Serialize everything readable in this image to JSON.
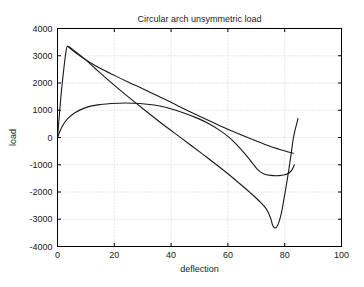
{
  "chart_data": {
    "type": "line",
    "title": "Circular arch unsymmetric load",
    "xlabel": "deflection",
    "ylabel": "load",
    "xlim": [
      0,
      100
    ],
    "ylim": [
      -4000,
      4000
    ],
    "xticks": [
      0,
      20,
      40,
      60,
      80,
      100
    ],
    "yticks": [
      -4000,
      -3000,
      -2000,
      -1000,
      0,
      1000,
      2000,
      3000,
      4000
    ],
    "xticklabels": [
      "0",
      "20",
      "40",
      "60",
      "80",
      "100"
    ],
    "yticklabels": [
      "-4000",
      "-3000",
      "-2000",
      "-1000",
      "0",
      "1000",
      "2000",
      "3000",
      "4000"
    ],
    "grid": true,
    "legend": null,
    "line_color": "#1a1a1a",
    "background": "#ffffff",
    "series": [
      {
        "name": "branch-1-steep-descending",
        "comment": "rises steeply from origin region to peak ~3350 then descends nearly linearly to lower right",
        "points": [
          [
            0,
            0
          ],
          [
            1.2,
            1500
          ],
          [
            2.2,
            2500
          ],
          [
            3.0,
            3150
          ],
          [
            3.6,
            3350
          ],
          [
            6,
            3180
          ],
          [
            9,
            2930
          ],
          [
            13,
            2560
          ],
          [
            17,
            2190
          ],
          [
            21,
            1830
          ],
          [
            26,
            1400
          ],
          [
            31,
            980
          ],
          [
            36,
            570
          ],
          [
            41,
            180
          ],
          [
            46,
            -210
          ],
          [
            51,
            -600
          ],
          [
            56,
            -1000
          ],
          [
            60,
            -1330
          ],
          [
            64,
            -1680
          ],
          [
            68,
            -2040
          ],
          [
            71,
            -2330
          ],
          [
            73.5,
            -2620
          ],
          [
            75,
            -2950
          ],
          [
            75.8,
            -3230
          ],
          [
            76.6,
            -3320
          ],
          [
            77.6,
            -3210
          ],
          [
            78.6,
            -2880
          ],
          [
            79.5,
            -2400
          ],
          [
            80.5,
            -1800
          ],
          [
            81.5,
            -1150
          ],
          [
            82.3,
            -580
          ],
          [
            82.9,
            -120
          ],
          [
            83.4,
            160
          ],
          [
            84.0,
            420
          ],
          [
            84.7,
            700
          ]
        ]
      },
      {
        "name": "branch-2-upper-descending",
        "comment": "from peak ~3350 descending with gentle convex curvature to about -580 at x=83",
        "points": [
          [
            3.6,
            3350
          ],
          [
            7,
            3060
          ],
          [
            11,
            2780
          ],
          [
            15,
            2540
          ],
          [
            20,
            2280
          ],
          [
            25,
            2030
          ],
          [
            30,
            1790
          ],
          [
            35,
            1540
          ],
          [
            40,
            1290
          ],
          [
            45,
            1030
          ],
          [
            50,
            780
          ],
          [
            55,
            540
          ],
          [
            60,
            300
          ],
          [
            65,
            80
          ],
          [
            70,
            -130
          ],
          [
            75,
            -330
          ],
          [
            78,
            -430
          ],
          [
            81,
            -520
          ],
          [
            83,
            -580
          ]
        ]
      },
      {
        "name": "branch-3-low-hump",
        "comment": "from origin rising to hump ~1250 near x=24-30 then falling to minimum ~-1400 near x=68 and back up",
        "points": [
          [
            0,
            0
          ],
          [
            1.5,
            380
          ],
          [
            3.5,
            680
          ],
          [
            6,
            900
          ],
          [
            9,
            1060
          ],
          [
            12,
            1160
          ],
          [
            15,
            1210
          ],
          [
            19,
            1250
          ],
          [
            24,
            1265
          ],
          [
            29,
            1250
          ],
          [
            34,
            1190
          ],
          [
            39,
            1080
          ],
          [
            44,
            920
          ],
          [
            49,
            720
          ],
          [
            53,
            520
          ],
          [
            57,
            270
          ],
          [
            60,
            40
          ],
          [
            63,
            -250
          ],
          [
            66,
            -600
          ],
          [
            68.5,
            -920
          ],
          [
            70.5,
            -1180
          ],
          [
            72.5,
            -1330
          ],
          [
            75,
            -1390
          ],
          [
            78,
            -1400
          ],
          [
            80,
            -1370
          ],
          [
            81.5,
            -1300
          ],
          [
            82.6,
            -1180
          ],
          [
            83.4,
            -1000
          ]
        ]
      }
    ]
  },
  "figure": {
    "title": "Circular arch unsymmetric load",
    "xlabel": "deflection",
    "ylabel": "load"
  }
}
